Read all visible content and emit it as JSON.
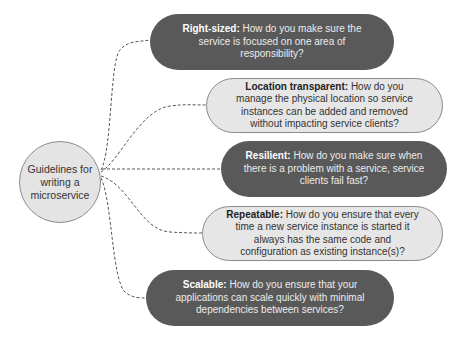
{
  "diagram": {
    "hub": {
      "label": "Guidelines for writing a microservice"
    },
    "guidelines": [
      {
        "title": "Right-sized:",
        "text": "How do you make sure the service is focused on one area of responsibility?",
        "style": "dark"
      },
      {
        "title": "Location transparent:",
        "text": "How do you manage the physical location so service instances can be added and removed without impacting service clients?",
        "style": "light"
      },
      {
        "title": "Resilient:",
        "text": "How do you make sure when there is a problem with a service, service clients fail fast?",
        "style": "dark"
      },
      {
        "title": "Repeatable:",
        "text": "How do you ensure that every time a new service instance is started it always has the same code and configuration as existing instance(s)?",
        "style": "light"
      },
      {
        "title": "Scalable:",
        "text": "How do you ensure that your applications can scale quickly with minimal dependencies between services?",
        "style": "dark"
      }
    ],
    "colors": {
      "dark_fill": "#595959",
      "light_fill": "#e6e6e6",
      "hub_fill": "#e4e4e4",
      "connector": "#555555"
    }
  }
}
